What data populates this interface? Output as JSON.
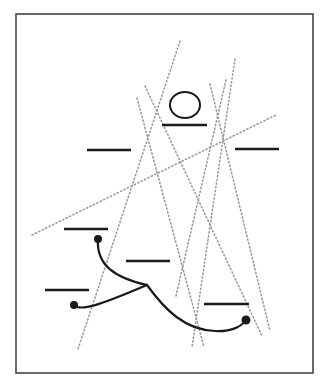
{
  "diagram": {
    "frame": {
      "x": 16,
      "y": 14,
      "width": 297,
      "height": 359,
      "stroke": "#444444"
    },
    "colors": {
      "ink": "#1a1a1a",
      "dotted": "#9a9a9a"
    },
    "ellipse": {
      "cx": 185,
      "cy": 105,
      "rx": 15,
      "ry": 13
    },
    "bars": [
      {
        "x1": 162,
        "x2": 207,
        "y": 125
      },
      {
        "x1": 87,
        "x2": 131,
        "y": 150
      },
      {
        "x1": 235,
        "x2": 279,
        "y": 149
      },
      {
        "x1": 64,
        "x2": 108,
        "y": 229
      },
      {
        "x1": 126,
        "x2": 170,
        "y": 261
      },
      {
        "x1": 45,
        "x2": 89,
        "y": 290
      },
      {
        "x1": 204,
        "x2": 249,
        "y": 304
      }
    ],
    "dotted_lines": [
      {
        "x1": 180,
        "y1": 41,
        "x2": 78,
        "y2": 349
      },
      {
        "x1": 137,
        "y1": 98,
        "x2": 204,
        "y2": 347
      },
      {
        "x1": 145,
        "y1": 86,
        "x2": 262,
        "y2": 336
      },
      {
        "x1": 235,
        "y1": 59,
        "x2": 192,
        "y2": 347
      },
      {
        "x1": 210,
        "y1": 84,
        "x2": 270,
        "y2": 331
      },
      {
        "x1": 226,
        "y1": 80,
        "x2": 176,
        "y2": 296
      },
      {
        "x1": 32,
        "y1": 235,
        "x2": 276,
        "y2": 115
      }
    ],
    "curves": [
      {
        "d": "M98,239 C96,265 115,278 147,285"
      },
      {
        "d": "M74,305 C80,312 100,305 147,285"
      },
      {
        "d": "M147,285 C165,310 185,330 215,331 C232,332 242,326 246,320"
      }
    ],
    "dots": [
      {
        "cx": 98,
        "cy": 239,
        "r": 4
      },
      {
        "cx": 74,
        "cy": 305,
        "r": 4
      },
      {
        "cx": 246,
        "cy": 320,
        "r": 4.5
      }
    ]
  }
}
